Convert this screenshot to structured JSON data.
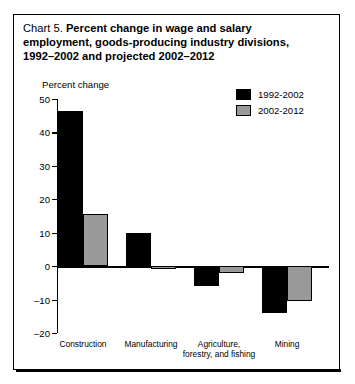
{
  "title": {
    "prefix": "Chart 5.",
    "line1": "Percent change in wage and salary",
    "line2": "employment, goods-producing industry divisions,",
    "line3": "1992–2002 and projected 2002–2012"
  },
  "axis_title": "Percent change",
  "legend": {
    "entries": [
      {
        "label": "1992-2002",
        "color": "#000000"
      },
      {
        "label": "2002-2012",
        "color": "#999999"
      }
    ]
  },
  "chart_data": {
    "type": "bar",
    "title": "Chart 5. Percent change in wage and salary employment, goods-producing industry divisions, 1992–2002 and projected 2002–2012",
    "xlabel": "",
    "ylabel": "Percent change",
    "ylim": [
      -20,
      50
    ],
    "yticks": [
      50,
      40,
      30,
      20,
      10,
      0,
      -10,
      -20
    ],
    "ytick_labels": [
      "50",
      "40",
      "30",
      "20",
      "10",
      "0",
      "–10",
      "–20"
    ],
    "grid": false,
    "legend_position": "top-right",
    "categories": [
      "Construction",
      "Manufacturing",
      "Agriculture, forestry, and fishing",
      "Mining"
    ],
    "category_lines": [
      [
        "Construction"
      ],
      [
        "Manufacturing"
      ],
      [
        "Agriculture,",
        "forestry, and fishing"
      ],
      [
        "Mining"
      ]
    ],
    "series": [
      {
        "name": "1992-2002",
        "color": "#000000",
        "values": [
          46.5,
          10,
          -6,
          -14
        ]
      },
      {
        "name": "2002-2012",
        "color": "#999999",
        "values": [
          15.5,
          -1,
          -2,
          -10.5
        ]
      }
    ]
  }
}
